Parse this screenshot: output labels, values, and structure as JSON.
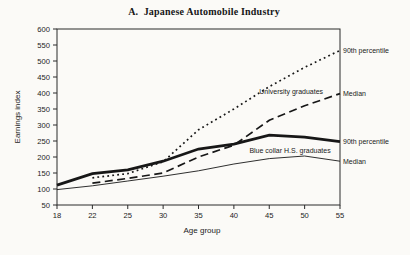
{
  "title": "A.  Japanese Automobile Industry",
  "ink_color": "#171717",
  "background_color": "#fbfaf7",
  "chart_data": {
    "type": "line",
    "title": "A.  Japanese Automobile Industry",
    "xlabel": "Age group",
    "ylabel": "Earnings index",
    "grid": false,
    "legend_position": "labels-at-line-ends",
    "ylim": [
      50,
      600
    ],
    "y_ticks": [
      50,
      100,
      150,
      200,
      250,
      300,
      350,
      400,
      450,
      500,
      550,
      600
    ],
    "categories": [
      18,
      22,
      25,
      30,
      35,
      40,
      45,
      50,
      55
    ],
    "series": [
      {
        "name": "University graduates — 90th percentile",
        "style": "dotted",
        "values": [
          null,
          135,
          148,
          185,
          285,
          350,
          420,
          480,
          533
        ]
      },
      {
        "name": "University graduates — Median",
        "style": "dashed",
        "values": [
          null,
          118,
          133,
          150,
          200,
          237,
          315,
          360,
          398
        ]
      },
      {
        "name": "Blue collar H.S. graduates — 90th percentile",
        "style": "thick",
        "values": [
          112,
          148,
          160,
          187,
          225,
          240,
          268,
          262,
          248
        ]
      },
      {
        "name": "Blue collar H.S. graduates — Median",
        "style": "thin",
        "values": [
          98,
          110,
          125,
          140,
          157,
          178,
          195,
          203,
          187
        ]
      }
    ],
    "annotations": [
      {
        "text": "University graduates",
        "x_frac": 0.715,
        "value": 405
      },
      {
        "text": "Blue collar H.S. graduates",
        "x_frac": 0.68,
        "value": 219
      }
    ],
    "right_labels": [
      {
        "text": "90th percentile",
        "value": 533
      },
      {
        "text": "Median",
        "value": 398
      },
      {
        "text": "90th percentile",
        "value": 248
      },
      {
        "text": "Median",
        "value": 187
      }
    ]
  }
}
